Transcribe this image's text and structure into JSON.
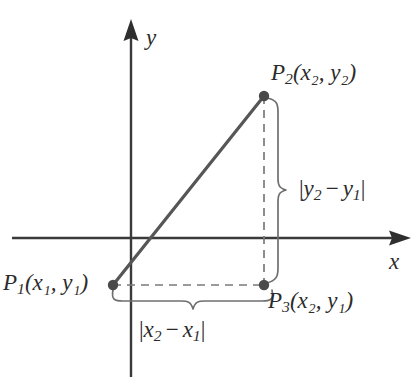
{
  "figure": {
    "background_color": "#ffffff",
    "width": 416,
    "height": 379
  },
  "colors": {
    "axis": "#3a3a3a",
    "segment": "#555555",
    "dashed": "#777777",
    "brace": "#6a6a6a",
    "point": "#4a4a4a",
    "text": "#2b2b2b"
  },
  "axes": {
    "x_label": "x",
    "y_label": "y",
    "origin": {
      "x": 131,
      "y": 238
    },
    "x_axis": {
      "x_start": 12,
      "x_end": 410,
      "y": 238,
      "arrow": "right"
    },
    "y_axis": {
      "x": 131,
      "y_start": 20,
      "y_end": 377,
      "arrow": "up"
    }
  },
  "points": [
    {
      "id": "P1",
      "label_base": "P",
      "label_sub": "1",
      "label_coords": "(x₁, y₁)",
      "label_full": "P₁(x₁, y₁)",
      "px": {
        "x": 113,
        "y": 285
      }
    },
    {
      "id": "P2",
      "label_base": "P",
      "label_sub": "2",
      "label_coords": "(x₂, y₂)",
      "label_full": "P₂(x₂, y₂)",
      "px": {
        "x": 264,
        "y": 96
      }
    },
    {
      "id": "P3",
      "label_base": "P",
      "label_sub": "3",
      "label_coords": "(x₂, y₁)",
      "label_full": "P₃(x₂, y₁)",
      "px": {
        "x": 264,
        "y": 285
      }
    }
  ],
  "segments": {
    "hypotenuse": {
      "from": "P1",
      "to": "P2",
      "style": "solid",
      "width": 3
    },
    "horizontal_leg": {
      "from": "P1",
      "to": "P3",
      "style": "dashed",
      "width": 1.6
    },
    "vertical_leg": {
      "from": "P3",
      "to": "P2",
      "style": "dashed",
      "width": 1.6
    }
  },
  "braces": {
    "vertical": {
      "label": "|y₂ − y₁|",
      "label_parts": {
        "open": "|",
        "a_base": "y",
        "a_sub": "2",
        "op": "−",
        "b_base": "y",
        "b_sub": "1",
        "close": "|"
      },
      "spans": "P2 to P3",
      "orientation": "opens-right",
      "x": 281,
      "y_top": 96,
      "y_bottom": 285,
      "tip_y": 190
    },
    "horizontal": {
      "label": "|x₂ − x₁|",
      "label_parts": {
        "open": "|",
        "a_base": "x",
        "a_sub": "2",
        "op": "−",
        "b_base": "x",
        "b_sub": "1",
        "close": "|"
      },
      "spans": "P1 to P3",
      "orientation": "opens-down",
      "y": 299,
      "x_left": 113,
      "x_right": 271,
      "tip_x": 190
    }
  }
}
